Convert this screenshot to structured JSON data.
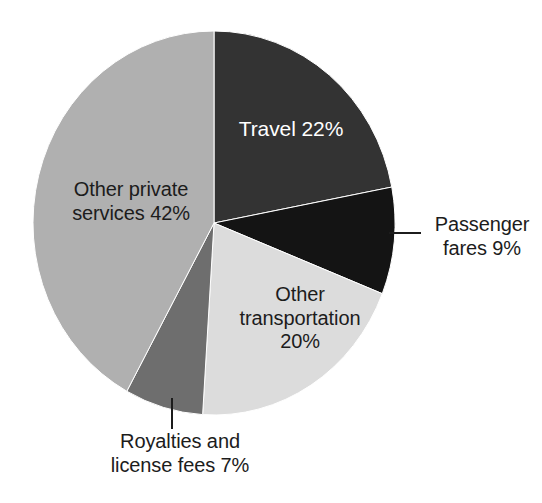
{
  "chart_data": {
    "type": "pie",
    "title": "",
    "subtitle": "",
    "xlabel": "",
    "ylabel": "",
    "legend_position": "none",
    "grid": false,
    "units": "percent",
    "start_angle_deg": 0,
    "direction": "clockwise",
    "categories": [
      "Travel",
      "Passenger fares",
      "Other transportation",
      "Royalties and license fees",
      "Other private services"
    ],
    "values": [
      22,
      9,
      20,
      7,
      42
    ],
    "slices": [
      {
        "name": "Travel",
        "value": 22,
        "label": "Travel 22%",
        "label_lines": "Travel 22%",
        "color": "#333333",
        "text_color": "#ffffff",
        "label_placement": "inside",
        "start_angle_deg": 0,
        "sweep_deg": 79.2
      },
      {
        "name": "Passenger fares",
        "value": 9,
        "label": "Passenger fares 9%",
        "label_lines": "Passenger\nfares 9%",
        "color": "#141414",
        "text_color": "#1c1c1c",
        "label_placement": "outside",
        "leader": "horizontal",
        "start_angle_deg": 79.2,
        "sweep_deg": 32.4
      },
      {
        "name": "Other transportation",
        "value": 20,
        "label": "Other transportation 20%",
        "label_lines": "Other\ntransportation\n20%",
        "color": "#dcdcdc",
        "text_color": "#1c1c1c",
        "label_placement": "inside",
        "start_angle_deg": 111.6,
        "sweep_deg": 72.0
      },
      {
        "name": "Royalties and license fees",
        "value": 7,
        "label": "Royalties and license fees 7%",
        "label_lines": "Royalties and\nlicense fees 7%",
        "color": "#6e6e6e",
        "text_color": "#1c1c1c",
        "label_placement": "outside",
        "leader": "vertical",
        "start_angle_deg": 183.6,
        "sweep_deg": 25.2
      },
      {
        "name": "Other private services",
        "value": 42,
        "label": "Other private services 42%",
        "label_lines": "Other private\nservices 42%",
        "color": "#b0b0b0",
        "text_color": "#1c1c1c",
        "label_placement": "inside",
        "start_angle_deg": 208.8,
        "sweep_deg": 151.2
      }
    ],
    "geometry": {
      "center_x": 214,
      "center_y": 223,
      "radius_x": 181,
      "radius_y": 192
    },
    "colors": {
      "background": "#ffffff",
      "travel": "#333333",
      "passenger_fares": "#141414",
      "other_transportation": "#dcdcdc",
      "royalties": "#6e6e6e",
      "other_private_services": "#b0b0b0",
      "label_dark": "#1c1c1c",
      "label_light": "#ffffff",
      "leader_line": "#1c1c1c"
    }
  }
}
